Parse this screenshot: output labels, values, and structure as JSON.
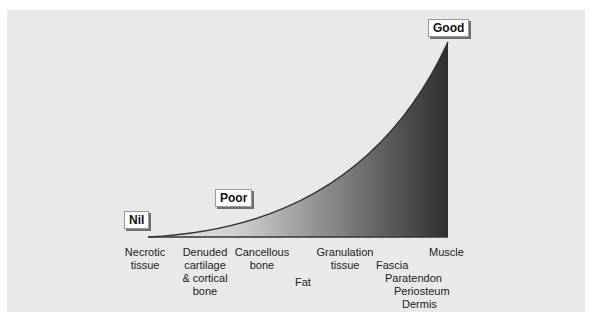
{
  "diagram": {
    "levels": {
      "nil": "Nil",
      "poor": "Poor",
      "good": "Good"
    },
    "tissues": {
      "necrotic": [
        "Necrotic",
        "tissue"
      ],
      "denuded": [
        "Denuded",
        "cartilage",
        "& cortical",
        "bone"
      ],
      "cancellous": [
        "Cancellous",
        "bone"
      ],
      "fat": "Fat",
      "granulation": [
        "Granulation",
        "tissue"
      ],
      "muscle": "Muscle",
      "fascia": "Fascia",
      "paratendon": "Paratendon",
      "periosteum": "Periosteum",
      "dermis": "Dermis"
    },
    "colors": {
      "background": "#e9e9e9",
      "curve_fill_light": "#e9e9e9",
      "curve_fill_dark": "#2e2e2e",
      "baseline": "#333333"
    }
  }
}
